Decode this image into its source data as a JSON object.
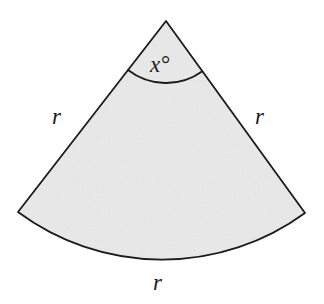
{
  "figure": {
    "kind": "circular-sector-diagram",
    "colors": {
      "fill": "#efefef",
      "stroke": "#1a1a1a",
      "text": "#1a1a1a",
      "background": "#ffffff"
    },
    "geometry": {
      "apex_x": 166,
      "apex_y": 21,
      "radius": 242,
      "left_corner_x": 18,
      "left_corner_y": 212,
      "right_corner_x": 305,
      "right_corner_y": 213,
      "angle_arc_radius": 62,
      "stroke_width": 1.8
    }
  },
  "labels": {
    "radius_left": "r",
    "radius_right": "r",
    "arc_length": "r",
    "central_angle": "x°"
  }
}
